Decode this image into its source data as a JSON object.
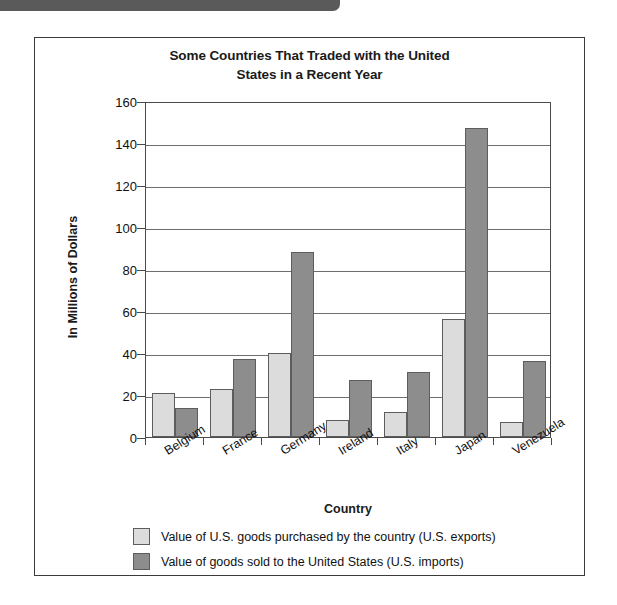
{
  "chart_data": {
    "type": "bar",
    "title": "Some Countries That Traded with the United States in a Recent Year",
    "title_lines": [
      "Some Countries That Traded with the United",
      "States in a Recent Year"
    ],
    "xlabel": "Country",
    "ylabel": "In Millions of Dollars",
    "ylim": [
      0,
      160
    ],
    "ytick_step": 20,
    "yticks": [
      0,
      20,
      40,
      60,
      80,
      100,
      120,
      140,
      160
    ],
    "ytick_labels": [
      "0",
      "20",
      "40",
      "60",
      "80",
      "100",
      "120",
      "140",
      "160"
    ],
    "grid": "horizontal",
    "legend_position": "below-plot-left",
    "categories": [
      "Belgium",
      "France",
      "Germany",
      "Ireland",
      "Italy",
      "Japan",
      "Venezuela"
    ],
    "series": [
      {
        "name": "Value of U.S. goods purchased by the country (U.S. exports)",
        "color": "#dcdcdc",
        "values": [
          21,
          23,
          40,
          8,
          12,
          56,
          7
        ]
      },
      {
        "name": "Value of goods sold to the United States (U.S. imports)",
        "color": "#8d8d8d",
        "values": [
          14,
          37,
          88,
          27,
          31,
          147,
          36
        ]
      }
    ]
  },
  "legend": {
    "items": [
      {
        "label": "Value of U.S. goods purchased by the country (U.S. exports)"
      },
      {
        "label": "Value of goods sold to the United States (U.S. imports)"
      }
    ]
  },
  "colors": {
    "exports_fill": "#dcdcdc",
    "imports_fill": "#8d8d8d",
    "bar_outline": "#5d5d5d",
    "frame": "#3b3b3b",
    "gridline": "#6e6e6e",
    "top_bar": "#5a5a5a"
  }
}
